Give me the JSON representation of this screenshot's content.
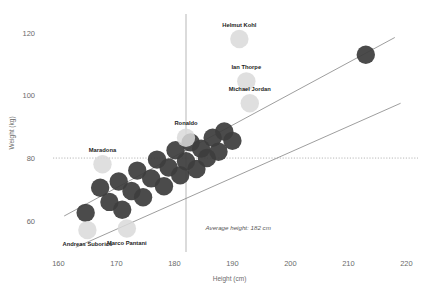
{
  "chart_data": {
    "type": "scatter",
    "title": "",
    "xlabel": "Height (cm)",
    "ylabel": "Weight (kg)",
    "xlim": [
      157,
      222
    ],
    "ylim": [
      50,
      126
    ],
    "xticks": [
      160,
      170,
      180,
      190,
      200,
      210,
      220
    ],
    "yticks": [
      60,
      80,
      100,
      120
    ],
    "grid": false,
    "legend": "none",
    "annotations": [
      {
        "text": "Average height: 182 cm",
        "x": 191,
        "y": 57,
        "style": "italic"
      }
    ],
    "reference_lines": [
      {
        "orientation": "vertical",
        "value": 182,
        "style": "solid-thin",
        "color": "#9a9a9a"
      },
      {
        "orientation": "horizontal",
        "value": 80,
        "style": "dotted",
        "color": "#9a9a9a"
      }
    ],
    "trend_lines": [
      {
        "name": "upper-band",
        "x1": 161,
        "y1": 61.5,
        "x2": 218,
        "y2": 118.5,
        "color": "#7d7d7d"
      },
      {
        "name": "lower-band",
        "x1": 163,
        "y1": 51.5,
        "x2": 219,
        "y2": 97.5,
        "color": "#7d7d7d"
      }
    ],
    "series": [
      {
        "name": "unlabeled-athletes",
        "color": "#3d3d3d",
        "points": [
          {
            "x": 164.7,
            "y": 62.5
          },
          {
            "x": 167.2,
            "y": 70.5
          },
          {
            "x": 168.8,
            "y": 66.0
          },
          {
            "x": 170.4,
            "y": 72.5
          },
          {
            "x": 171.0,
            "y": 63.5
          },
          {
            "x": 172.6,
            "y": 69.5
          },
          {
            "x": 173.6,
            "y": 76.0
          },
          {
            "x": 174.6,
            "y": 67.5
          },
          {
            "x": 176.0,
            "y": 73.5
          },
          {
            "x": 177.0,
            "y": 79.5
          },
          {
            "x": 178.2,
            "y": 71.0
          },
          {
            "x": 179.0,
            "y": 77.0
          },
          {
            "x": 180.2,
            "y": 82.5
          },
          {
            "x": 181.0,
            "y": 74.5
          },
          {
            "x": 182.0,
            "y": 79.0
          },
          {
            "x": 182.8,
            "y": 85.0
          },
          {
            "x": 183.8,
            "y": 76.5
          },
          {
            "x": 184.6,
            "y": 83.0
          },
          {
            "x": 185.6,
            "y": 80.0
          },
          {
            "x": 186.6,
            "y": 86.5
          },
          {
            "x": 187.6,
            "y": 82.0
          },
          {
            "x": 188.6,
            "y": 88.5
          },
          {
            "x": 190.0,
            "y": 85.5
          },
          {
            "x": 213.0,
            "y": 113.0
          }
        ]
      },
      {
        "name": "named-individuals",
        "color": "#d9d9d9",
        "points": [
          {
            "x": 165.0,
            "y": 57.0,
            "label": "Andreas Suborics",
            "label_pos": "below"
          },
          {
            "x": 171.8,
            "y": 57.5,
            "label": "Marco Pantani",
            "label_pos": "below"
          },
          {
            "x": 167.6,
            "y": 78.0,
            "label": "Maradona",
            "label_pos": "above"
          },
          {
            "x": 182.0,
            "y": 86.5,
            "label": "Ronaldo",
            "label_pos": "above"
          },
          {
            "x": 191.2,
            "y": 118.0,
            "label": "Helmut Kohl",
            "label_pos": "above"
          },
          {
            "x": 192.4,
            "y": 104.5,
            "label": "Ian Thorpe",
            "label_pos": "above"
          },
          {
            "x": 193.0,
            "y": 97.5,
            "label": "Michael Jordan",
            "label_pos": "above"
          }
        ]
      }
    ]
  }
}
